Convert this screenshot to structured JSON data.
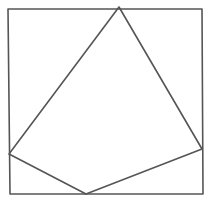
{
  "diagram": {
    "type": "geometry-sketch",
    "stroke_color": "#555555",
    "background": "#ffffff",
    "square": {
      "points": [
        [
          8,
          9
        ],
        [
          202,
          9
        ],
        [
          203,
          194
        ],
        [
          10,
          194
        ]
      ]
    },
    "quadrilateral": {
      "vertices": {
        "top": [
          119,
          7
        ],
        "right": [
          202,
          149
        ],
        "bottom": [
          86,
          194
        ],
        "left": [
          9,
          154
        ]
      }
    }
  }
}
